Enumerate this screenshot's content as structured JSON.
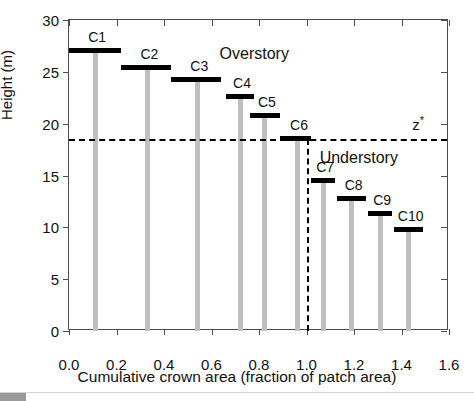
{
  "chart_data": {
    "type": "bar",
    "title": "",
    "xlabel": "Cumulative crown area (fraction of patch area)",
    "ylabel": "Height (m)",
    "xlim": [
      0.0,
      1.6
    ],
    "ylim": [
      0,
      30
    ],
    "xticks": [
      "0.0",
      "0.2",
      "0.4",
      "0.6",
      "0.8",
      "1.0",
      "1.2",
      "1.4",
      "1.6"
    ],
    "xtick_values": [
      0.0,
      0.2,
      0.4,
      0.6,
      0.8,
      1.0,
      1.2,
      1.4,
      1.6
    ],
    "yticks": [
      "0",
      "5",
      "10",
      "15",
      "20",
      "25",
      "30"
    ],
    "ytick_values": [
      0,
      5,
      10,
      15,
      20,
      25,
      30
    ],
    "grid": false,
    "legend": null,
    "series": [
      {
        "name": "Cohort crowns",
        "description": "Each cohort drawn as a horizontal crown bar spanning its cumulative crown-area interval, with a vertical trunk stem down to the ground.",
        "items": [
          {
            "label": "C1",
            "x_start": 0.0,
            "x_end": 0.22,
            "stem_x": 0.11,
            "height": 27.1
          },
          {
            "label": "C2",
            "x_start": 0.22,
            "x_end": 0.43,
            "stem_x": 0.33,
            "height": 25.5
          },
          {
            "label": "C3",
            "x_start": 0.43,
            "x_end": 0.64,
            "stem_x": 0.54,
            "height": 24.3
          },
          {
            "label": "C4",
            "x_start": 0.66,
            "x_end": 0.78,
            "stem_x": 0.72,
            "height": 22.7
          },
          {
            "label": "C5",
            "x_start": 0.76,
            "x_end": 0.89,
            "stem_x": 0.825,
            "height": 20.8
          },
          {
            "label": "C6",
            "x_start": 0.89,
            "x_end": 1.02,
            "stem_x": 0.96,
            "height": 18.6
          },
          {
            "label": "C7",
            "x_start": 1.02,
            "x_end": 1.12,
            "stem_x": 1.07,
            "height": 14.6
          },
          {
            "label": "C8",
            "x_start": 1.13,
            "x_end": 1.25,
            "stem_x": 1.19,
            "height": 12.8
          },
          {
            "label": "C9",
            "x_start": 1.26,
            "x_end": 1.36,
            "stem_x": 1.31,
            "height": 11.4
          },
          {
            "label": "C10",
            "x_start": 1.37,
            "x_end": 1.49,
            "stem_x": 1.43,
            "height": 9.8
          }
        ]
      }
    ],
    "reference_lines": [
      {
        "name": "z-star-horizontal",
        "orientation": "horizontal",
        "value": 18.5,
        "style": "dashed",
        "label": "z*"
      },
      {
        "name": "patch-area-vertical",
        "orientation": "vertical",
        "value": 1.0,
        "style": "dashed",
        "y_from": 0,
        "y_to": 18.5
      }
    ],
    "annotations": [
      {
        "name": "overstory-label",
        "text": "Overstory",
        "x": 0.78,
        "y": 26.6
      },
      {
        "name": "understory-label",
        "text": "Understory",
        "x": 1.22,
        "y": 16.6
      },
      {
        "name": "z-star-label",
        "text": "z",
        "sup": "*",
        "x": 1.47,
        "y": 20.0
      }
    ]
  },
  "axis": {
    "y_title": "Height (m)",
    "x_title": "Cumulative crown area (fraction of patch area)"
  }
}
